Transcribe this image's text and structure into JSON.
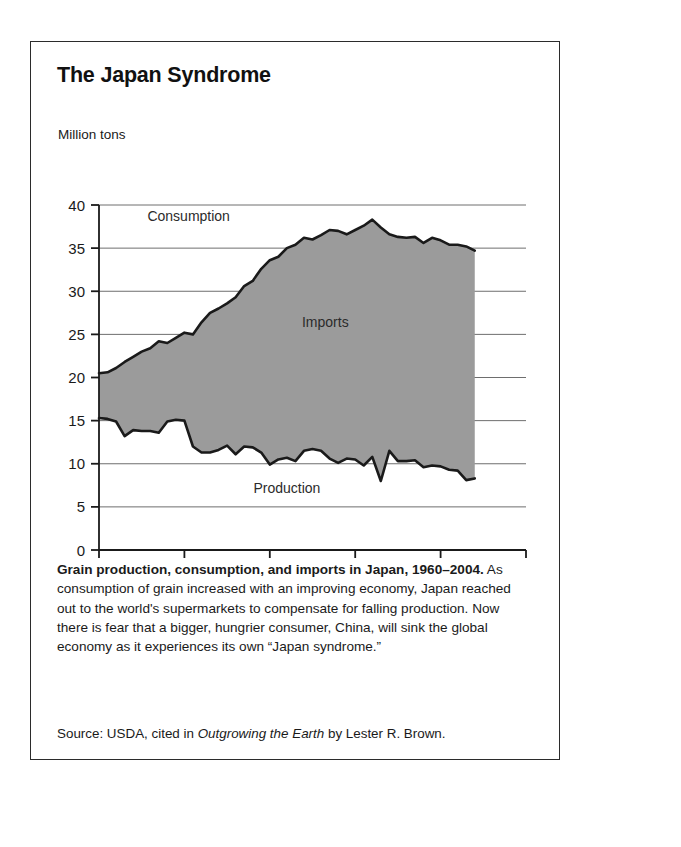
{
  "figure": {
    "title": "The Japan Syndrome",
    "y_unit_label": "Million tons",
    "caption_lead": "Grain production, consumption, and imports in Japan, 1960–2004.",
    "caption_body": " As consumption of grain increased with an improving economy, Japan reached out to the world's supermarkets to compensate for falling production. Now there is fear that a bigger, hungrier consumer, China, will sink the global economy as it experiences its own “Japan syndrome.”",
    "source_prefix": "Source: USDA, cited in ",
    "source_work": "Outgrowing the Earth",
    "source_suffix": " by Lester R. Brown."
  },
  "colors": {
    "fill_gray": "#9b9b9b",
    "line_black": "#1a1a1a",
    "grid_gray": "#6e6e6e",
    "frame": "#2b2b2b"
  },
  "chart_data": {
    "type": "area",
    "title": "The Japan Syndrome",
    "subtitle": "Grain production, consumption, and imports in Japan, 1960–2004",
    "xlabel": "",
    "ylabel": "Million tons",
    "xlim": [
      1960,
      2010
    ],
    "ylim": [
      0,
      40
    ],
    "xticks": [
      1960,
      1970,
      1980,
      1990,
      2000,
      2010
    ],
    "yticks": [
      0,
      5,
      10,
      15,
      20,
      25,
      30,
      35,
      40
    ],
    "grid": true,
    "legend": "inline-annotations",
    "annotations": [
      {
        "text": "Consumption",
        "x": 1970.5,
        "y": 38.2
      },
      {
        "text": "Imports",
        "x": 1986.5,
        "y": 25.8
      },
      {
        "text": "Production",
        "x": 1982.0,
        "y": 6.6
      }
    ],
    "x": [
      1960,
      1961,
      1962,
      1963,
      1964,
      1965,
      1966,
      1967,
      1968,
      1969,
      1970,
      1971,
      1972,
      1973,
      1974,
      1975,
      1976,
      1977,
      1978,
      1979,
      1980,
      1981,
      1982,
      1983,
      1984,
      1985,
      1986,
      1987,
      1988,
      1989,
      1990,
      1991,
      1992,
      1993,
      1994,
      1995,
      1996,
      1997,
      1998,
      1999,
      2000,
      2001,
      2002,
      2003,
      2004
    ],
    "series": [
      {
        "name": "Consumption",
        "values": [
          20.5,
          20.6,
          21.1,
          21.8,
          22.4,
          23.0,
          23.4,
          24.2,
          24.0,
          24.6,
          25.2,
          25.0,
          26.4,
          27.5,
          28.0,
          28.6,
          29.3,
          30.6,
          31.2,
          32.6,
          33.6,
          34.0,
          35.0,
          35.4,
          36.2,
          36.0,
          36.5,
          37.1,
          37.0,
          36.6,
          37.1,
          37.6,
          38.3,
          37.4,
          36.6,
          36.3,
          36.2,
          36.3,
          35.6,
          36.2,
          35.9,
          35.4,
          35.4,
          35.2,
          34.7
        ]
      },
      {
        "name": "Production",
        "values": [
          15.3,
          15.2,
          14.9,
          13.2,
          13.9,
          13.8,
          13.8,
          13.6,
          14.9,
          15.1,
          15.0,
          12.0,
          11.3,
          11.3,
          11.6,
          12.1,
          11.1,
          12.0,
          11.9,
          11.3,
          9.9,
          10.5,
          10.7,
          10.3,
          11.5,
          11.7,
          11.5,
          10.6,
          10.1,
          10.6,
          10.5,
          9.8,
          10.8,
          8.0,
          11.5,
          10.3,
          10.3,
          10.4,
          9.6,
          9.8,
          9.7,
          9.3,
          9.2,
          8.1,
          8.3
        ]
      }
    ],
    "derived_series": {
      "name": "Imports",
      "description": "Shaded gray band between Production (lower) and Consumption (upper)"
    }
  }
}
